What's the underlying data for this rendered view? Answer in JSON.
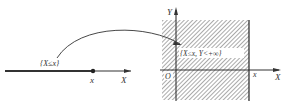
{
  "left_panel": {
    "axis_label": "X",
    "point_label": "x",
    "event_label": "{X≤x}"
  },
  "right_panel": {
    "x_axis_label": "X",
    "y_axis_label": "Y",
    "origin_label": "O",
    "boundary_label": "x",
    "region_label": "{X≤x, Y<+∞}"
  },
  "colors": {
    "line": "#333333",
    "hatch": "#555555",
    "background": "#ffffff"
  }
}
